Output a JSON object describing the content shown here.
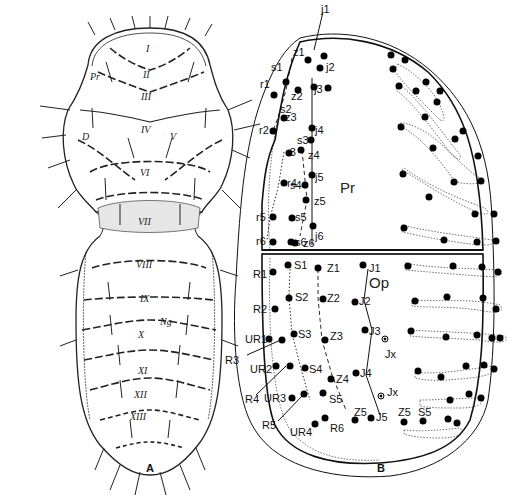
{
  "figure": {
    "panels": [
      {
        "id": "A",
        "label": "A",
        "description": "Dorsal view of mite with segment numbering",
        "segment_labels": [
          "I",
          "II",
          "III",
          "IV",
          "V",
          "VI",
          "VII",
          "VIII",
          "IX",
          "X",
          "XI",
          "XII",
          "XIII"
        ],
        "region_labels": {
          "prosoma": "Pr",
          "dorsal": "D",
          "ng": "Ng"
        },
        "extra_labels": {
          "iv_left": "IV"
        }
      },
      {
        "id": "B",
        "label": "B",
        "description": "Dorsal shield chaetotaxy diagram",
        "region_labels": {
          "podonotal": "Pr",
          "opisthonotal": "Op"
        },
        "podonotal_setae": {
          "j": [
            "j1",
            "j2",
            "j3",
            "j4",
            "j5",
            "j6"
          ],
          "z": [
            "z1",
            "z2",
            "z3",
            "z4",
            "z5",
            "z6"
          ],
          "s": [
            "s1",
            "s2",
            "s3",
            "s4",
            "s5",
            "s6"
          ],
          "r": [
            "r1",
            "r2",
            "r3",
            "r4",
            "r5",
            "r6"
          ]
        },
        "opisthonotal_setae": {
          "J": [
            "J1",
            "J2",
            "J3",
            "J4",
            "J5"
          ],
          "Z": [
            "Z1",
            "Z2",
            "Z3",
            "Z4",
            "Z5"
          ],
          "S": [
            "S1",
            "S2",
            "S3",
            "S4",
            "S5"
          ],
          "R": [
            "R1",
            "R2",
            "R3",
            "R4",
            "R5",
            "R6"
          ],
          "UR": [
            "UR1",
            "UR2",
            "UR3",
            "UR4"
          ],
          "Jx": [
            "Jx",
            "Jx"
          ],
          "right_side": [
            "Z5",
            "S5"
          ]
        }
      }
    ]
  }
}
